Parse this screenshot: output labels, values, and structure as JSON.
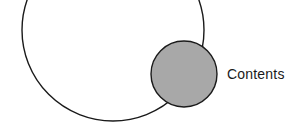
{
  "diagram": {
    "outer_circle": {
      "cx": 113,
      "cy": 30,
      "r": 91,
      "fill": "#ffffff",
      "stroke": "#1a1a1a"
    },
    "inner_circle": {
      "cx": 184,
      "cy": 74,
      "r": 33,
      "fill": "#a8a8a8",
      "stroke": "#1a1a1a"
    },
    "label": "Contents"
  }
}
